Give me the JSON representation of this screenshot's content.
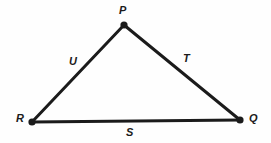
{
  "figure": {
    "kind": "triangle-diagram",
    "background_color": "#fefefe",
    "stroke_color": "#1b1b1b",
    "stroke_width": 3,
    "vertex_dot_radius": 3.5,
    "vertices": [
      {
        "name": "P",
        "label": "P",
        "x": 124,
        "y": 25
      },
      {
        "name": "Q",
        "label": "Q",
        "x": 240,
        "y": 120
      },
      {
        "name": "R",
        "label": "R",
        "x": 32,
        "y": 122
      }
    ],
    "sides": [
      {
        "name": "PR",
        "label": "U",
        "from": "P",
        "to": "R"
      },
      {
        "name": "PQ",
        "label": "T",
        "from": "P",
        "to": "Q"
      },
      {
        "name": "RQ",
        "label": "S",
        "from": "R",
        "to": "Q"
      }
    ],
    "labels": {
      "P": "P",
      "Q": "Q",
      "R": "R",
      "S": "S",
      "T": "T",
      "U": "U"
    }
  }
}
